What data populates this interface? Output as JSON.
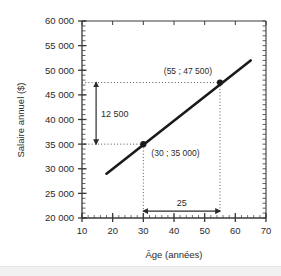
{
  "chart_data": {
    "type": "line",
    "title": "",
    "xlabel": "Âge (années)",
    "ylabel": "Salaire annuel ($)",
    "xlim": [
      10,
      70
    ],
    "ylim": [
      20000,
      60000
    ],
    "x_ticks": [
      10,
      20,
      30,
      40,
      50,
      60,
      70
    ],
    "x_tick_labels": [
      "10",
      "20",
      "30",
      "40",
      "50",
      "60",
      "70"
    ],
    "y_ticks": [
      20000,
      25000,
      30000,
      35000,
      40000,
      45000,
      50000,
      55000,
      60000
    ],
    "y_tick_labels": [
      "20 000",
      "25 000",
      "30 000",
      "35 000",
      "40 000",
      "45 000",
      "50 000",
      "55 000",
      "60 000"
    ],
    "x_minor_step": 2,
    "y_minor_step": 1000,
    "grid": false,
    "legend": "none",
    "series": [
      {
        "name": "Salaire annuel selon l'âge",
        "x": [
          18,
          65
        ],
        "y": [
          29000,
          52000
        ],
        "color": "#1a1a1a"
      }
    ],
    "points": [
      {
        "x": 30,
        "y": 35000,
        "label": "(30 ; 35 000)"
      },
      {
        "x": 55,
        "y": 47500,
        "label": "(55 ; 47 500)"
      }
    ],
    "annotations": [
      {
        "name": "rise",
        "label": "12 500",
        "orientation": "vertical",
        "from": 35000,
        "to": 47500,
        "at_x": 14.6
      },
      {
        "name": "run",
        "label": "25",
        "orientation": "horizontal",
        "from": 30,
        "to": 55,
        "at_y": 21400
      }
    ],
    "colors": {
      "line": "#1a1a1a",
      "axis": "#3a3a3a",
      "guide": "#555555",
      "text": "#2b2b2b",
      "background": "#ffffff"
    }
  }
}
